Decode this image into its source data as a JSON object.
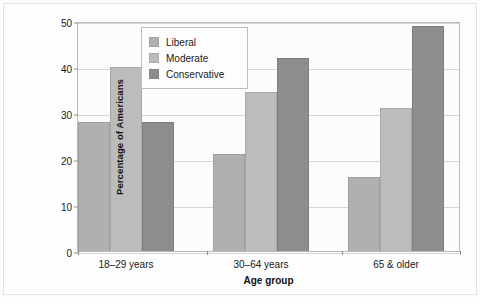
{
  "chart_data": {
    "type": "bar",
    "title": "",
    "xlabel": "Age group",
    "ylabel": "Percentage of Americans",
    "categories": [
      "18–29 years",
      "30–64 years",
      "65 & older"
    ],
    "series": [
      {
        "name": "Liberal",
        "color": "#b0b0b0",
        "values": [
          28,
          21,
          16
        ]
      },
      {
        "name": "Moderate",
        "color": "#bcbcbc",
        "values": [
          40,
          34.5,
          31
        ]
      },
      {
        "name": "Conservative",
        "color": "#8d8d8d",
        "values": [
          28,
          42,
          49
        ]
      }
    ],
    "ylim": [
      0,
      50
    ],
    "yticks": [
      0,
      10,
      20,
      30,
      40,
      50
    ],
    "ytick_labels": [
      "0",
      "10",
      "20",
      "30",
      "40",
      "50"
    ],
    "grid": "horizontal",
    "legend_position": "top-left-inside"
  },
  "legend": {
    "items": [
      {
        "label": "Liberal"
      },
      {
        "label": "Moderate"
      },
      {
        "label": "Conservative"
      }
    ]
  },
  "axes": {
    "y_title": "Percentage of Americans",
    "x_title": "Age group"
  }
}
